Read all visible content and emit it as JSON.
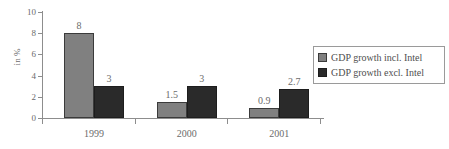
{
  "chart_data": {
    "type": "bar",
    "title": "",
    "subtitle": "",
    "xlabel": "",
    "ylabel": "in %",
    "categories": [
      "1999",
      "2000",
      "2001"
    ],
    "series": [
      {
        "name": "GDP growth incl. Intel",
        "color": "#808080",
        "values": [
          8,
          1.5,
          0.9
        ],
        "labels": [
          "8",
          "1.5",
          "0.9"
        ]
      },
      {
        "name": "GDP growth excl. Intel",
        "color": "#2a2a2a",
        "values": [
          3,
          3,
          2.7
        ],
        "labels": [
          "3",
          "3",
          "2.7"
        ]
      }
    ],
    "ylim": [
      0,
      10
    ],
    "ytick_values": [
      0,
      2,
      4,
      6,
      8,
      10
    ],
    "ytick_labels": [
      "0",
      "2",
      "4",
      "6",
      "8",
      "10"
    ],
    "grid": false,
    "legend_position": "right",
    "data_labels_shown": true
  },
  "legend": {
    "items": [
      {
        "label": "GDP growth incl. Intel",
        "swatch": "series-0"
      },
      {
        "label": "GDP growth excl. Intel",
        "swatch": "series-1"
      }
    ]
  }
}
